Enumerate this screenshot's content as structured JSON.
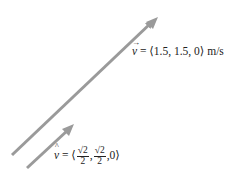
{
  "diagram": {
    "title": "",
    "colors": {
      "arrow": "#9a9a9a",
      "text": "#222222",
      "background": "#ffffff"
    },
    "arrows": [
      {
        "name": "velocity-vector",
        "from": [
          12,
          155
        ],
        "to": [
          157,
          18
        ]
      },
      {
        "name": "unit-vector",
        "from": [
          27,
          168
        ],
        "to": [
          73,
          125
        ]
      }
    ],
    "velocity_label": {
      "symbol": "v",
      "accent": "→",
      "equals": " = ",
      "value": "⟨1.5, 1.5, 0⟩",
      "units": " m/s"
    },
    "unit_label": {
      "symbol": "v",
      "accent": "^",
      "equals": " = ",
      "open": "⟨",
      "frac1_num": "√2",
      "frac1_den": "2",
      "sep1": ",",
      "frac2_num": "√2",
      "frac2_den": "2",
      "sep2": ",",
      "last": "0",
      "close": "⟩"
    }
  }
}
